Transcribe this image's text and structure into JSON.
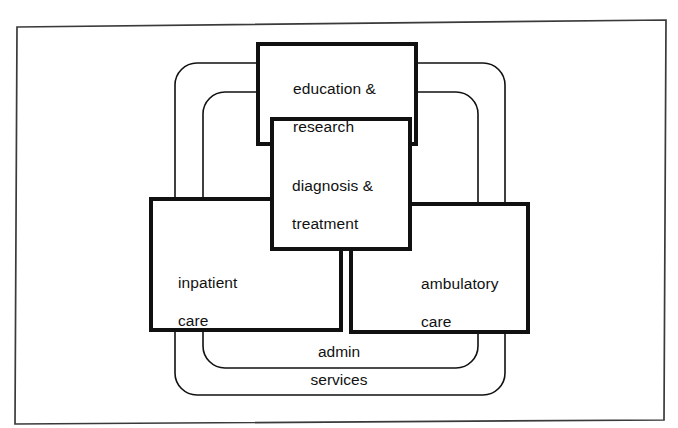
{
  "document": {
    "type": "organizational-venn-diagram",
    "title": "",
    "background_color": "#ffffff",
    "ink_color": "#111111"
  },
  "frame": {
    "name": "scanned-page-border",
    "visible": true,
    "color": "#3a3a3a"
  },
  "diagram": {
    "boxes": [
      {
        "id": "education-research",
        "label": "education &\nresearch",
        "line1": "education &",
        "line2": "research",
        "x": 258,
        "y": 44,
        "width": 158,
        "height": 100,
        "border_width": 4,
        "border_color": "#111111",
        "fill": "#ffffff"
      },
      {
        "id": "diagnosis-treatment",
        "label": "diagnosis &\ntreatment",
        "line1": "diagnosis &",
        "line2": "treatment",
        "x": 272,
        "y": 119,
        "width": 138,
        "height": 130,
        "border_width": 4,
        "border_color": "#111111",
        "fill": "#ffffff"
      },
      {
        "id": "inpatient-care",
        "label": "inpatient\ncare",
        "line1": "inpatient",
        "line2": "care",
        "x": 151,
        "y": 199,
        "width": 190,
        "height": 131,
        "border_width": 4,
        "border_color": "#111111",
        "fill": "#ffffff"
      },
      {
        "id": "ambulatory-care",
        "label": "ambulatory\ncare",
        "line1": "ambulatory",
        "line2": "care",
        "x": 351,
        "y": 204,
        "width": 177,
        "height": 128,
        "border_width": 4,
        "border_color": "#111111",
        "fill": "#ffffff"
      }
    ],
    "envelopes": [
      {
        "id": "services-envelope",
        "label": "services",
        "x": 175,
        "y": 63,
        "width": 330,
        "height": 332,
        "radius": 22,
        "border_width": 1.6,
        "border_color": "#111111"
      },
      {
        "id": "admin-envelope",
        "label": "admin",
        "x": 203,
        "y": 92,
        "width": 275,
        "height": 276,
        "radius": 22,
        "border_width": 1.6,
        "border_color": "#111111"
      }
    ],
    "envelope_labels": [
      {
        "id": "admin-label",
        "text": "admin",
        "cx": 339,
        "cy": 352
      },
      {
        "id": "services-label",
        "text": "services",
        "cx": 339,
        "cy": 380
      }
    ]
  }
}
